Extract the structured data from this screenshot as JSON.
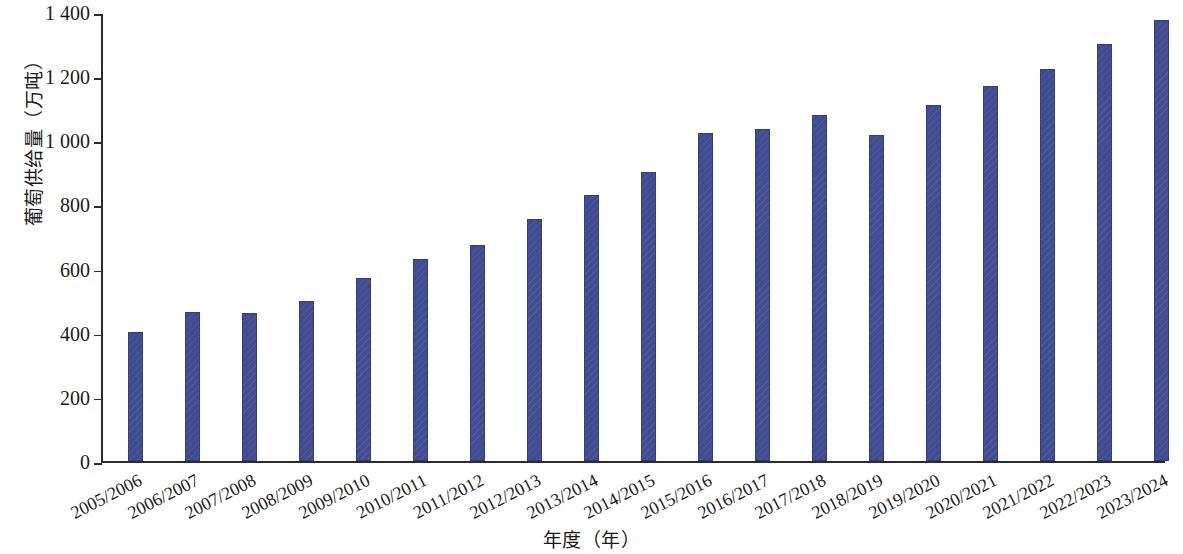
{
  "chart_data": {
    "type": "bar",
    "title": "",
    "xlabel": "年度（年）",
    "ylabel": "葡萄供给量（万吨）",
    "ylim": [
      0,
      1400
    ],
    "ytick_values": [
      0,
      200,
      400,
      600,
      800,
      1000,
      1200,
      1400
    ],
    "ytick_labels": [
      "0",
      "200",
      "400",
      "600",
      "800",
      "1 000",
      "1 200",
      "1 400"
    ],
    "grid": false,
    "legend": false,
    "bar_color": "#3f4c92",
    "categories": [
      "2005/2006",
      "2006/2007",
      "2007/2008",
      "2008/2009",
      "2009/2010",
      "2010/2011",
      "2011/2012",
      "2012/2013",
      "2013/2014",
      "2014/2015",
      "2015/2016",
      "2016/2017",
      "2017/2018",
      "2018/2019",
      "2019/2020",
      "2020/2021",
      "2021/2022",
      "2022/2023",
      "2023/2024"
    ],
    "values": [
      405,
      465,
      462,
      500,
      572,
      630,
      675,
      755,
      830,
      903,
      1025,
      1035,
      1080,
      1018,
      1110,
      1172,
      1225,
      1302,
      1377
    ]
  }
}
